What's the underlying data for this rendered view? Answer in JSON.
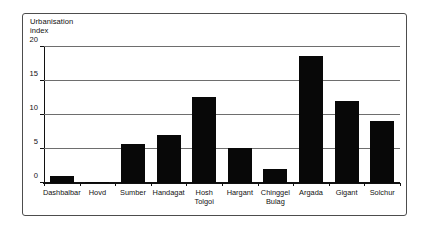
{
  "chart_data": {
    "type": "bar",
    "title": "Urbanisation\nindex",
    "xlabel": "",
    "ylabel": "Urbanisation index",
    "ylim": [
      0,
      20
    ],
    "yticks": [
      0,
      5,
      10,
      15,
      20
    ],
    "ytick_labels": [
      "0",
      "5",
      "10",
      "15",
      "20"
    ],
    "grid": "horizontal",
    "legend": "none",
    "bar_color": "#080808",
    "categories": [
      "Dashbalbar",
      "Hovd",
      "Sumber",
      "Handagat",
      "Hosh\nTolgoi",
      "Hargant",
      "Chinggel\nBulag",
      "Argada",
      "Gigant",
      "Solchur"
    ],
    "values": [
      1.1,
      0.2,
      5.7,
      7.0,
      12.7,
      5.1,
      2.0,
      18.7,
      12.0,
      9.1
    ]
  },
  "figure": {
    "border_color": "#4d4d4d",
    "background": "#ffffff"
  }
}
